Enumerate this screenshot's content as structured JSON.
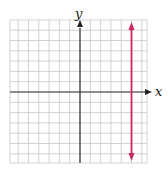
{
  "figure": {
    "type": "coordinate-plane",
    "x_axis_label": "x",
    "y_axis_label": "y",
    "grid": {
      "x_min": -7,
      "x_max": 6.5,
      "y_min": -7,
      "y_max": 7,
      "step": 1,
      "color": "#c8c8c8"
    },
    "axis_color": "#333333",
    "line": {
      "equation": "x = 5",
      "x": 5,
      "color": "#c8285a",
      "arrows": "both-ends"
    }
  },
  "chart_data": {
    "type": "line",
    "title": "",
    "xlabel": "x",
    "ylabel": "y",
    "series": [
      {
        "name": "x = 5",
        "x": [
          5,
          5
        ],
        "y": [
          -7,
          7
        ],
        "color": "#c8285a"
      }
    ],
    "xlim": [
      -7,
      6.5
    ],
    "ylim": [
      -7,
      7
    ],
    "grid": true,
    "legend": "none"
  }
}
